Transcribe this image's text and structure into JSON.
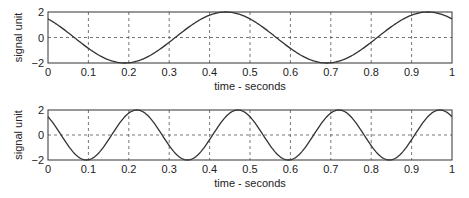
{
  "chart_data": [
    {
      "type": "line",
      "title": "",
      "xlabel": "time - seconds",
      "ylabel": "signal unit",
      "xlim": [
        0,
        1
      ],
      "ylim": [
        -2,
        2
      ],
      "xticks": [
        "0",
        "0.1",
        "0.2",
        "0.3",
        "0.4",
        "0.5",
        "0.6",
        "0.7",
        "0.8",
        "0.9",
        "1"
      ],
      "yticks": [
        "−2",
        "0",
        "2"
      ],
      "grid": true,
      "series": [
        {
          "name": "signal",
          "frequency_hz": 2,
          "amplitude": 2,
          "peak_time": 0.44,
          "x": [
            0,
            0.05,
            0.1,
            0.15,
            0.19,
            0.25,
            0.3,
            0.35,
            0.4,
            0.44,
            0.5,
            0.55,
            0.6,
            0.65,
            0.69,
            0.75,
            0.8,
            0.85,
            0.9,
            0.94,
            1.0
          ],
          "values": [
            1.46,
            0.75,
            -0.13,
            -0.97,
            -2.0,
            -1.46,
            -0.63,
            0.25,
            1.46,
            2.0,
            1.46,
            0.63,
            -0.25,
            -1.46,
            -2.0,
            -1.46,
            -0.25,
            0.75,
            1.46,
            2.0,
            1.46
          ]
        }
      ]
    },
    {
      "type": "line",
      "title": "",
      "xlabel": "time - seconds",
      "ylabel": "signal unit",
      "xlim": [
        0,
        1
      ],
      "ylim": [
        -2,
        2
      ],
      "xticks": [
        "0",
        "0.1",
        "0.2",
        "0.3",
        "0.4",
        "0.5",
        "0.6",
        "0.7",
        "0.8",
        "0.9",
        "1"
      ],
      "yticks": [
        "−2",
        "0",
        "2"
      ],
      "grid": true,
      "series": [
        {
          "name": "signal",
          "frequency_hz": 4,
          "amplitude": 2,
          "peak_time": 0.22,
          "x": [
            0,
            0.035,
            0.1,
            0.16,
            0.22,
            0.285,
            0.35,
            0.41,
            0.47,
            0.535,
            0.6,
            0.66,
            0.72,
            0.785,
            0.85,
            0.91,
            0.97,
            1.0
          ],
          "values": [
            1.46,
            0.0,
            -2.0,
            0.0,
            2.0,
            0.0,
            -2.0,
            0.0,
            2.0,
            0.0,
            -2.0,
            0.0,
            2.0,
            0.0,
            -2.0,
            0.0,
            2.0,
            1.46
          ]
        }
      ]
    }
  ],
  "plots": [
    {
      "xlabel": "time - seconds",
      "ylabel": "signal unit",
      "freq": 2,
      "peak": 0.44
    },
    {
      "xlabel": "time - seconds",
      "ylabel": "signal unit",
      "freq": 4,
      "peak": 0.22
    }
  ],
  "colors": {
    "line": "#333333",
    "axis": "#333333",
    "grid": "#555555"
  }
}
